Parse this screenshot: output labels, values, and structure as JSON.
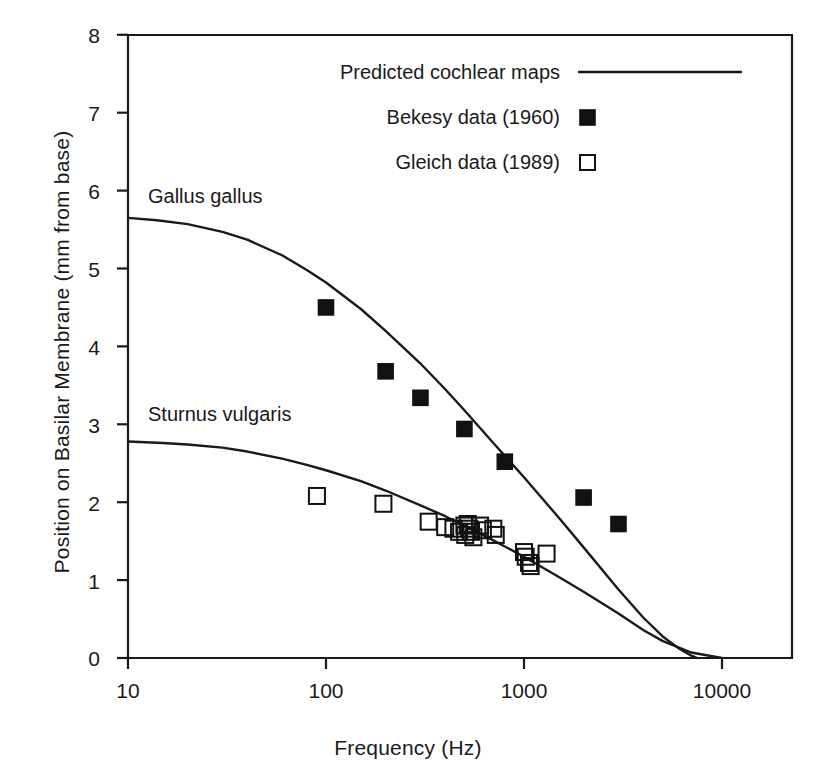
{
  "chart_data": {
    "type": "scatter",
    "title": "",
    "xlabel": "Frequency (Hz)",
    "ylabel": "Position on Basilar Membrane (mm from base)",
    "xscale": "log",
    "xlim": [
      10,
      15000
    ],
    "ylim": [
      0,
      8
    ],
    "xticks": [
      10,
      100,
      1000,
      10000
    ],
    "xtick_labels": [
      "10",
      "100",
      "1000",
      "10000"
    ],
    "yticks": [
      0,
      1,
      2,
      3,
      4,
      5,
      6,
      7,
      8
    ],
    "ytick_labels": [
      "0",
      "1",
      "2",
      "3",
      "4",
      "5",
      "6",
      "7",
      "8"
    ],
    "grid": false,
    "legend_position": "top-center",
    "legend": [
      {
        "label": "Predicted cochlear maps",
        "marker": "line"
      },
      {
        "label": "Bekesy data (1960)",
        "marker": "filled-square"
      },
      {
        "label": "Gleich data (1989)",
        "marker": "open-square"
      }
    ],
    "annotations": [
      {
        "text": "Gallus gallus",
        "x": 12,
        "y": 6.0
      },
      {
        "text": "Sturnus vulgaris",
        "x": 12,
        "y": 3.05
      }
    ],
    "series": [
      {
        "name": "Gallus gallus predicted cochlear map",
        "type": "line",
        "marker": "line",
        "points": [
          [
            10,
            5.65
          ],
          [
            14,
            5.62
          ],
          [
            20,
            5.57
          ],
          [
            30,
            5.47
          ],
          [
            40,
            5.37
          ],
          [
            60,
            5.17
          ],
          [
            80,
            4.98
          ],
          [
            100,
            4.82
          ],
          [
            150,
            4.48
          ],
          [
            200,
            4.2
          ],
          [
            300,
            3.78
          ],
          [
            400,
            3.45
          ],
          [
            500,
            3.18
          ],
          [
            700,
            2.76
          ],
          [
            1000,
            2.32
          ],
          [
            1500,
            1.8
          ],
          [
            2000,
            1.42
          ],
          [
            3000,
            0.88
          ],
          [
            4000,
            0.52
          ],
          [
            5000,
            0.28
          ],
          [
            6000,
            0.13
          ],
          [
            7000,
            0.03
          ],
          [
            7500,
            0.0
          ]
        ]
      },
      {
        "name": "Sturnus vulgaris predicted cochlear map",
        "type": "line",
        "marker": "line",
        "points": [
          [
            10,
            2.78
          ],
          [
            15,
            2.76
          ],
          [
            20,
            2.74
          ],
          [
            30,
            2.7
          ],
          [
            40,
            2.65
          ],
          [
            60,
            2.56
          ],
          [
            80,
            2.48
          ],
          [
            100,
            2.41
          ],
          [
            150,
            2.27
          ],
          [
            200,
            2.15
          ],
          [
            300,
            1.96
          ],
          [
            400,
            1.82
          ],
          [
            500,
            1.7
          ],
          [
            700,
            1.51
          ],
          [
            1000,
            1.3
          ],
          [
            1500,
            1.04
          ],
          [
            2000,
            0.85
          ],
          [
            3000,
            0.57
          ],
          [
            4000,
            0.36
          ],
          [
            5000,
            0.22
          ],
          [
            7000,
            0.07
          ],
          [
            10000,
            0.0
          ]
        ]
      },
      {
        "name": "Bekesy data (1960)",
        "type": "scatter",
        "marker": "filled-square",
        "points": [
          [
            100,
            4.5
          ],
          [
            200,
            3.68
          ],
          [
            300,
            3.34
          ],
          [
            500,
            2.94
          ],
          [
            800,
            2.52
          ],
          [
            2000,
            2.06
          ],
          [
            3000,
            1.72
          ]
        ]
      },
      {
        "name": "Gleich data (1989)",
        "type": "scatter",
        "marker": "open-square",
        "points": [
          [
            90,
            2.08
          ],
          [
            195,
            1.98
          ],
          [
            330,
            1.75
          ],
          [
            400,
            1.68
          ],
          [
            440,
            1.66
          ],
          [
            470,
            1.62
          ],
          [
            500,
            1.7
          ],
          [
            505,
            1.58
          ],
          [
            520,
            1.72
          ],
          [
            530,
            1.66
          ],
          [
            540,
            1.62
          ],
          [
            555,
            1.55
          ],
          [
            600,
            1.7
          ],
          [
            620,
            1.64
          ],
          [
            700,
            1.66
          ],
          [
            720,
            1.58
          ],
          [
            1000,
            1.36
          ],
          [
            1020,
            1.3
          ],
          [
            1060,
            1.22
          ],
          [
            1080,
            1.18
          ],
          [
            1300,
            1.34
          ]
        ]
      }
    ]
  }
}
